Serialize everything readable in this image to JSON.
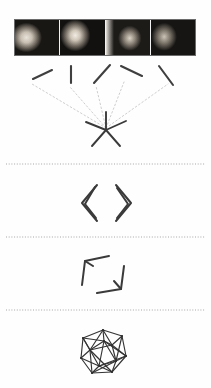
{
  "figure": {
    "caption": "",
    "background_color": "#fefefe",
    "ink_color": "#3a3a3a",
    "faint_ink_color": "#b9b9b9",
    "separator_color": "#9a9a9a",
    "width": 211,
    "height": 388
  },
  "filmstrip": {
    "name": "input-video-frames",
    "border_color": "#6b6b6b",
    "frame_count": 4,
    "frames": [
      {
        "label": "frame-1",
        "description": "dark photograph of a lit face in profile at left with a second shadowed face at right"
      },
      {
        "label": "frame-2",
        "description": "dark photograph of a face turned three-quarters toward the left"
      },
      {
        "label": "frame-3",
        "description": "dark photograph with a bright vertical edge and a face at right"
      },
      {
        "label": "frame-4",
        "description": "dark photograph of two faces, the right one brightly lit"
      }
    ]
  },
  "panels": [
    {
      "name": "fan-star-panel",
      "title": "",
      "strokes": [
        {
          "name": "stroke-1",
          "x1": 33,
          "y1": 79,
          "x2": 52,
          "y2": 70,
          "angle_deg": -25
        },
        {
          "name": "stroke-2",
          "x1": 71,
          "y1": 66,
          "x2": 71,
          "y2": 83,
          "angle_deg": 90
        },
        {
          "name": "stroke-3",
          "x1": 94,
          "y1": 83,
          "x2": 110,
          "y2": 65,
          "angle_deg": -48
        },
        {
          "name": "stroke-4",
          "x1": 121,
          "y1": 66,
          "x2": 142,
          "y2": 76,
          "angle_deg": 25
        },
        {
          "name": "stroke-5",
          "x1": 159,
          "y1": 66,
          "x2": 173,
          "y2": 85,
          "angle_deg": 54
        }
      ],
      "rays": [
        {
          "name": "ray-1",
          "x1": 106,
          "y1": 128,
          "x2": 32,
          "y2": 84
        },
        {
          "name": "ray-2",
          "x1": 106,
          "y1": 128,
          "x2": 70,
          "y2": 87
        },
        {
          "name": "ray-3",
          "x1": 106,
          "y1": 128,
          "x2": 96,
          "y2": 86
        },
        {
          "name": "ray-4",
          "x1": 106,
          "y1": 128,
          "x2": 124,
          "y2": 82
        },
        {
          "name": "ray-5",
          "x1": 106,
          "y1": 128,
          "x2": 168,
          "y2": 84
        }
      ],
      "star": {
        "name": "convergence-star",
        "center_x": 106,
        "center_y": 130,
        "spokes": [
          {
            "x2": 86,
            "y2": 122
          },
          {
            "x2": 106,
            "y2": 112
          },
          {
            "x2": 126,
            "y2": 121
          },
          {
            "x2": 120,
            "y2": 146
          },
          {
            "x2": 92,
            "y2": 146
          }
        ]
      }
    },
    {
      "name": "chevron-pair-panel",
      "title": "",
      "shapes": [
        {
          "name": "left-chevron",
          "points": "97,185 82,203 97,221"
        },
        {
          "name": "left-chevron-inner",
          "points": "95,187 85,204 96,218"
        },
        {
          "name": "right-chevron",
          "points": "116,185 131,203 116,221"
        },
        {
          "name": "right-chevron-inner",
          "points": "117,188 128,204 117,218"
        }
      ]
    },
    {
      "name": "arrow-pair-panel",
      "title": "",
      "shapes": [
        {
          "name": "upper-left-arrow",
          "points": "82,285 85,261 109,256"
        },
        {
          "name": "upper-left-arrow-barb",
          "points": "85,261 93,266"
        },
        {
          "name": "lower-right-arrow",
          "points": "97,293 121,289 124,266"
        },
        {
          "name": "lower-right-arrow-barb",
          "points": "121,289 114,281"
        }
      ]
    },
    {
      "name": "polyhedron-panel",
      "title": "",
      "graph": {
        "name": "icosahedral-wireframe",
        "center_x": 103,
        "center_y": 352,
        "radius": 23,
        "vertex_count": 12,
        "nodes": [
          {
            "id": 0,
            "x": 103,
            "y": 330
          },
          {
            "id": 1,
            "x": 122,
            "y": 336
          },
          {
            "id": 2,
            "x": 126,
            "y": 356
          },
          {
            "id": 3,
            "x": 112,
            "y": 372
          },
          {
            "id": 4,
            "x": 92,
            "y": 373
          },
          {
            "id": 5,
            "x": 81,
            "y": 358
          },
          {
            "id": 6,
            "x": 83,
            "y": 338
          },
          {
            "id": 7,
            "x": 112,
            "y": 345
          },
          {
            "id": 8,
            "x": 116,
            "y": 361
          },
          {
            "id": 9,
            "x": 99,
            "y": 366
          },
          {
            "id": 10,
            "x": 90,
            "y": 350
          },
          {
            "id": 11,
            "x": 104,
            "y": 341
          }
        ],
        "edges": [
          [
            0,
            1
          ],
          [
            1,
            2
          ],
          [
            2,
            3
          ],
          [
            3,
            4
          ],
          [
            4,
            5
          ],
          [
            5,
            6
          ],
          [
            6,
            0
          ],
          [
            0,
            11
          ],
          [
            11,
            7
          ],
          [
            7,
            1
          ],
          [
            7,
            2
          ],
          [
            7,
            8
          ],
          [
            8,
            2
          ],
          [
            8,
            3
          ],
          [
            8,
            9
          ],
          [
            9,
            3
          ],
          [
            9,
            4
          ],
          [
            9,
            10
          ],
          [
            10,
            4
          ],
          [
            10,
            5
          ],
          [
            10,
            6
          ],
          [
            10,
            11
          ],
          [
            11,
            6
          ],
          [
            11,
            8
          ],
          [
            0,
            7
          ],
          [
            1,
            8
          ],
          [
            5,
            9
          ],
          [
            2,
            9
          ],
          [
            6,
            10
          ],
          [
            3,
            10
          ],
          [
            7,
            10
          ],
          [
            0,
            10
          ],
          [
            11,
            2
          ],
          [
            11,
            9
          ],
          [
            4,
            8
          ]
        ]
      }
    }
  ],
  "separators": [
    {
      "name": "separator-1",
      "y": 164,
      "x1": 6,
      "x2": 205,
      "style": "dotted"
    },
    {
      "name": "separator-2",
      "y": 237,
      "x1": 6,
      "x2": 205,
      "style": "dotted"
    },
    {
      "name": "separator-3",
      "y": 310,
      "x1": 6,
      "x2": 205,
      "style": "dotted"
    }
  ]
}
